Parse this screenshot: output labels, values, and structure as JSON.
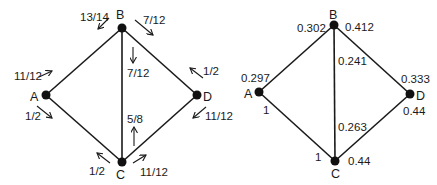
{
  "left_graph": {
    "nodes": {
      "A": {
        "label": "A"
      },
      "B": {
        "label": "B"
      },
      "C": {
        "label": "C"
      },
      "D": {
        "label": "D"
      }
    },
    "edges": [
      "A-B",
      "A-C",
      "B-C",
      "B-D",
      "C-D"
    ],
    "arrow_labels": {
      "B_to_A": "13/14",
      "B_to_D": "7/12",
      "B_to_C": "7/12",
      "A_to_B": "11/12",
      "A_to_C": "1/2",
      "D_to_B": "1/2",
      "D_to_C": "11/12",
      "C_to_B": "5/8",
      "C_to_A": "1/2",
      "C_to_D": "11/12"
    }
  },
  "right_graph": {
    "nodes": {
      "A": {
        "label": "A"
      },
      "B": {
        "label": "B"
      },
      "C": {
        "label": "C"
      },
      "D": {
        "label": "D"
      }
    },
    "edges": [
      "A-B",
      "A-C",
      "B-C",
      "B-D",
      "C-D"
    ],
    "values": {
      "B_left": "0.302",
      "B_right": "0.412",
      "BC_upper": "0.241",
      "A_upper": "0.297",
      "A_lower": "1",
      "D_upper": "0.333",
      "D_lower": "0.44",
      "BC_lower": "0.263",
      "C_left": "1",
      "C_right": "0.44"
    }
  }
}
